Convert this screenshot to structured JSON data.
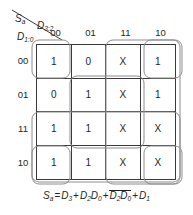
{
  "figure": {
    "type": "karnaugh-map",
    "corner": {
      "output_label": "Sa",
      "output_base": "S",
      "output_sub": "a",
      "column_var_base": "D",
      "column_var_sub": "3:2",
      "row_var_base": "D",
      "row_var_sub": "1:0"
    },
    "column_headers": [
      "00",
      "01",
      "11",
      "10"
    ],
    "row_headers": [
      "00",
      "01",
      "11",
      "10"
    ],
    "cells": [
      [
        "1",
        "0",
        "X",
        "1"
      ],
      [
        "0",
        "1",
        "X",
        "1"
      ],
      [
        "1",
        "1",
        "X",
        "X"
      ],
      [
        "1",
        "1",
        "X",
        "X"
      ]
    ],
    "groups": [
      {
        "name": "group-d3-column-11-10",
        "x": 78,
        "y": 4,
        "w": 74,
        "h": 144,
        "rx": 7
      },
      {
        "name": "group-d1-rows-11-10",
        "x": 4,
        "y": 76,
        "w": 148,
        "h": 70,
        "rx": 7
      },
      {
        "name": "group-d2d0",
        "x": 42,
        "y": 40,
        "w": 74,
        "h": 72,
        "rx": 7
      },
      {
        "name": "group-d2bar-d0bar-left",
        "x": 4,
        "y": 4,
        "w": 38,
        "h": 38,
        "rx": 7
      },
      {
        "name": "group-d2bar-d0bar-right",
        "x": 116,
        "y": 4,
        "w": 38,
        "h": 38,
        "rx": 7
      },
      {
        "name": "group-d2bar-d0bar-bottom-left",
        "x": 4,
        "y": 110,
        "w": 38,
        "h": 38,
        "rx": 7
      },
      {
        "name": "group-d2bar-d0bar-bottom-right",
        "x": 116,
        "y": 110,
        "w": 38,
        "h": 38,
        "rx": 7
      }
    ],
    "equation": {
      "full_text": "Sa = D3 + D2D0 + D2'D0' + D1",
      "lhs_base": "S",
      "lhs_sub": "a",
      "eq": "=",
      "t1_base": "D",
      "t1_sub": "3",
      "plus1": "+",
      "t2a_base": "D",
      "t2a_sub": "2",
      "t2b_base": "D",
      "t2b_sub": "0",
      "plus2": "+",
      "t3a_base": "D",
      "t3a_sub": "2",
      "t3b_base": "D",
      "t3b_sub": "0",
      "plus3": "+",
      "t4_base": "D",
      "t4_sub": "1"
    }
  },
  "chart_data": {
    "type": "table",
    "xlabel": "D3:2",
    "ylabel": "D1:0",
    "categories": [
      "00",
      "01",
      "11",
      "10"
    ],
    "row_categories": [
      "00",
      "01",
      "11",
      "10"
    ],
    "values": [
      [
        "1",
        "0",
        "X",
        "1"
      ],
      [
        "0",
        "1",
        "X",
        "1"
      ],
      [
        "1",
        "1",
        "X",
        "X"
      ],
      [
        "1",
        "1",
        "X",
        "X"
      ]
    ],
    "minterms_one": [
      "0000",
      "0101",
      "1100",
      "1101",
      "1000",
      "1001",
      "0110",
      "0010"
    ],
    "dont_cares": [
      "1100-col11 all rows"
    ],
    "annotations": [
      "Sa = D3 + D2D0 + D2'D0' + D1"
    ]
  }
}
